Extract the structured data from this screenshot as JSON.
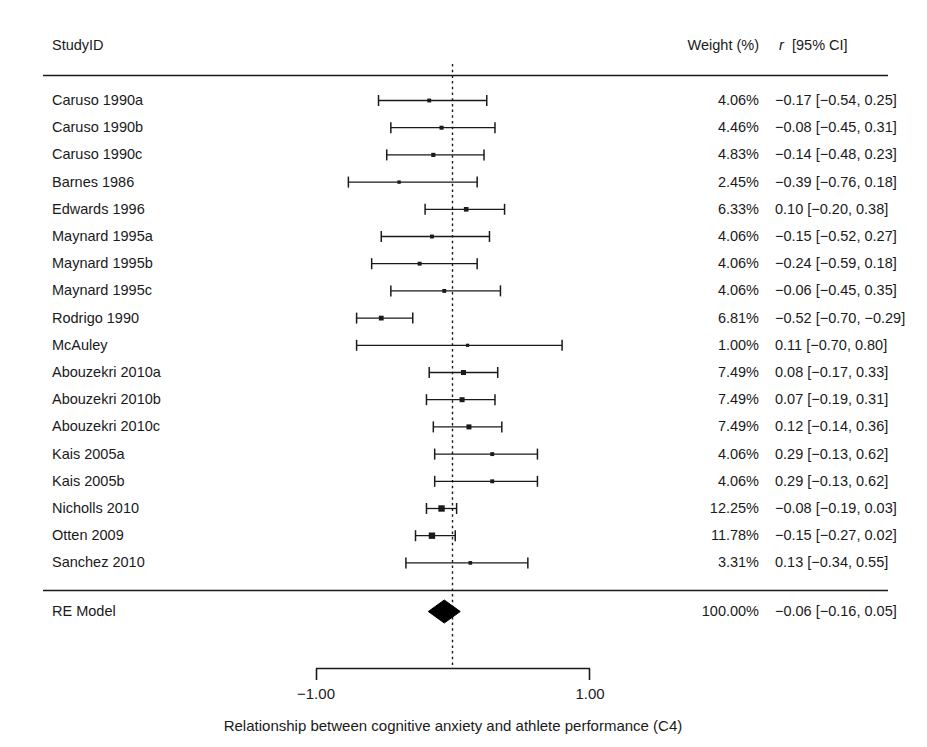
{
  "header": {
    "study_col": "StudyID",
    "weight_col": "Weight (%)",
    "estimate_col_italic": "r",
    "estimate_col_rest": "[95% CI]"
  },
  "caption": "Relationship between cognitive anxiety and athlete performance (C4)",
  "axis": {
    "ticks": [
      "−1.00",
      "1.00"
    ],
    "tick_values": [
      -1.0,
      1.0
    ],
    "zero_value": 0.0
  },
  "summary": {
    "label": "RE Model",
    "weight": "100.00%",
    "estimate_text": "−0.06 [−0.16,  0.05]",
    "estimate": -0.06,
    "ci_low": -0.16,
    "ci_high": 0.05
  },
  "chart_data": {
    "type": "forest",
    "title": "Relationship between cognitive anxiety and athlete performance (C4)",
    "xlabel": "",
    "ylabel": "",
    "xlim": [
      -1.0,
      1.0
    ],
    "effect_measure": "r",
    "ci_level": "95%",
    "grid": false,
    "legend": "none",
    "reference_line": 0.0,
    "studies": [
      {
        "study": "Caruso 1990a",
        "weight": "4.06%",
        "weight_value": 4.06,
        "estimate": -0.17,
        "ci_low": -0.54,
        "ci_high": 0.25,
        "estimate_text": "−0.17 [−0.54,  0.25]"
      },
      {
        "study": "Caruso 1990b",
        "weight": "4.46%",
        "weight_value": 4.46,
        "estimate": -0.08,
        "ci_low": -0.45,
        "ci_high": 0.31,
        "estimate_text": "−0.08 [−0.45,  0.31]"
      },
      {
        "study": "Caruso 1990c",
        "weight": "4.83%",
        "weight_value": 4.83,
        "estimate": -0.14,
        "ci_low": -0.48,
        "ci_high": 0.23,
        "estimate_text": "−0.14 [−0.48,  0.23]"
      },
      {
        "study": "Barnes 1986",
        "weight": "2.45%",
        "weight_value": 2.45,
        "estimate": -0.39,
        "ci_low": -0.76,
        "ci_high": 0.18,
        "estimate_text": "−0.39 [−0.76,  0.18]"
      },
      {
        "study": "Edwards 1996",
        "weight": "6.33%",
        "weight_value": 6.33,
        "estimate": 0.1,
        "ci_low": -0.2,
        "ci_high": 0.38,
        "estimate_text": "0.10 [−0.20,  0.38]"
      },
      {
        "study": "Maynard 1995a",
        "weight": "4.06%",
        "weight_value": 4.06,
        "estimate": -0.15,
        "ci_low": -0.52,
        "ci_high": 0.27,
        "estimate_text": "−0.15 [−0.52,  0.27]"
      },
      {
        "study": "Maynard 1995b",
        "weight": "4.06%",
        "weight_value": 4.06,
        "estimate": -0.24,
        "ci_low": -0.59,
        "ci_high": 0.18,
        "estimate_text": "−0.24 [−0.59,  0.18]"
      },
      {
        "study": "Maynard 1995c",
        "weight": "4.06%",
        "weight_value": 4.06,
        "estimate": -0.06,
        "ci_low": -0.45,
        "ci_high": 0.35,
        "estimate_text": "−0.06 [−0.45,  0.35]"
      },
      {
        "study": "Rodrigo 1990",
        "weight": "6.81%",
        "weight_value": 6.81,
        "estimate": -0.52,
        "ci_low": -0.7,
        "ci_high": -0.29,
        "estimate_text": "−0.52 [−0.70, −0.29]"
      },
      {
        "study": "McAuley",
        "weight": "1.00%",
        "weight_value": 1.0,
        "estimate": 0.11,
        "ci_low": -0.7,
        "ci_high": 0.8,
        "estimate_text": "0.11 [−0.70,  0.80]"
      },
      {
        "study": "Abouzekri 2010a",
        "weight": "7.49%",
        "weight_value": 7.49,
        "estimate": 0.08,
        "ci_low": -0.17,
        "ci_high": 0.33,
        "estimate_text": "0.08 [−0.17,  0.33]"
      },
      {
        "study": "Abouzekri 2010b",
        "weight": "7.49%",
        "weight_value": 7.49,
        "estimate": 0.07,
        "ci_low": -0.19,
        "ci_high": 0.31,
        "estimate_text": "0.07 [−0.19,  0.31]"
      },
      {
        "study": "Abouzekri 2010c",
        "weight": "7.49%",
        "weight_value": 7.49,
        "estimate": 0.12,
        "ci_low": -0.14,
        "ci_high": 0.36,
        "estimate_text": "0.12 [−0.14,  0.36]"
      },
      {
        "study": "Kais 2005a",
        "weight": "4.06%",
        "weight_value": 4.06,
        "estimate": 0.29,
        "ci_low": -0.13,
        "ci_high": 0.62,
        "estimate_text": "0.29 [−0.13,  0.62]"
      },
      {
        "study": "Kais 2005b",
        "weight": "4.06%",
        "weight_value": 4.06,
        "estimate": 0.29,
        "ci_low": -0.13,
        "ci_high": 0.62,
        "estimate_text": "0.29 [−0.13,  0.62]"
      },
      {
        "study": "Nicholls 2010",
        "weight": "12.25%",
        "weight_value": 12.25,
        "estimate": -0.08,
        "ci_low": -0.19,
        "ci_high": 0.03,
        "estimate_text": "−0.08 [−0.19,  0.03]"
      },
      {
        "study": "Otten 2009",
        "weight": "11.78%",
        "weight_value": 11.78,
        "estimate": -0.15,
        "ci_low": -0.27,
        "ci_high": 0.02,
        "estimate_text": "−0.15 [−0.27,  0.02]"
      },
      {
        "study": "Sanchez 2010",
        "weight": "3.31%",
        "weight_value": 3.31,
        "estimate": 0.13,
        "ci_low": -0.34,
        "ci_high": 0.55,
        "estimate_text": "0.13 [−0.34,  0.55]"
      }
    ],
    "summary": {
      "label": "RE Model",
      "weight": "100.00%",
      "estimate": -0.06,
      "ci_low": -0.16,
      "ci_high": 0.05,
      "estimate_text": "−0.06 [−0.16,  0.05]"
    }
  }
}
